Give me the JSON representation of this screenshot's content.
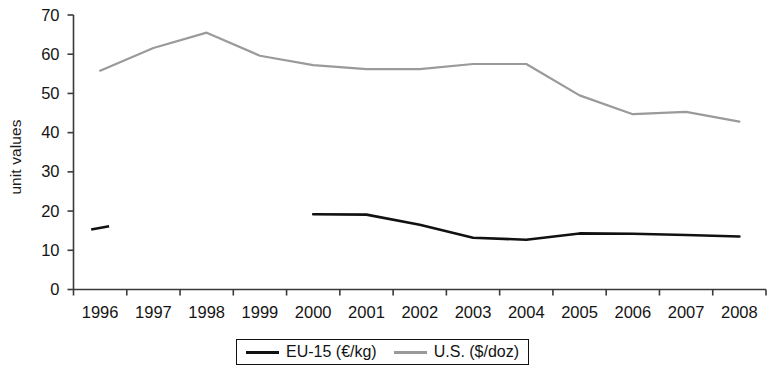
{
  "chart_data": {
    "type": "line",
    "title": "",
    "xlabel": "",
    "ylabel": "unit values",
    "categories": [
      "1996",
      "1997",
      "1998",
      "1999",
      "2000",
      "2001",
      "2002",
      "2003",
      "2004",
      "2005",
      "2006",
      "2007",
      "2008"
    ],
    "ylim": [
      0,
      70
    ],
    "yticks": [
      0,
      10,
      20,
      30,
      40,
      50,
      60,
      70
    ],
    "grid": false,
    "legend_position": "bottom",
    "series": [
      {
        "name": "EU-15 (€/kg)",
        "color": "#111111",
        "values": [
          15.7,
          null,
          null,
          null,
          19.2,
          19.1,
          16.5,
          13.2,
          12.7,
          14.3,
          14.2,
          13.9,
          13.5
        ]
      },
      {
        "name": "U.S. ($/doz)",
        "color": "#9a9a9a",
        "values": [
          55.8,
          61.6,
          65.5,
          59.6,
          57.2,
          56.2,
          56.2,
          57.5,
          57.5,
          49.5,
          44.7,
          45.3,
          42.8
        ]
      }
    ]
  },
  "axis": {
    "y_title": "unit values",
    "y_tick_labels": [
      "70",
      "60",
      "50",
      "40",
      "30",
      "20",
      "10",
      "0"
    ],
    "x_tick_labels": [
      "1996",
      "1997",
      "1998",
      "1999",
      "2000",
      "2001",
      "2002",
      "2003",
      "2004",
      "2005",
      "2006",
      "2007",
      "2008"
    ]
  },
  "legend": {
    "items": [
      {
        "label": "EU-15 (€/kg)",
        "color": "#111111"
      },
      {
        "label": "U.S. ($/doz)",
        "color": "#9a9a9a"
      }
    ]
  }
}
